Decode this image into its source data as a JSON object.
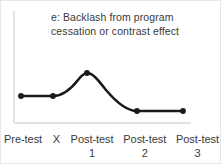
{
  "chart_data": {
    "type": "line",
    "title": "e: Backlash from program\ncessation or contrast effect",
    "xlabel": "",
    "ylabel": "",
    "categories": [
      "Pre-test",
      "X",
      "Post-test 1",
      "Post-test 2",
      "Post-test 3"
    ],
    "tick_labels": [
      {
        "main": "Pre-test",
        "sub": ""
      },
      {
        "main": "X",
        "sub": ""
      },
      {
        "main": "Post-test",
        "sub": "1"
      },
      {
        "main": "Post-test",
        "sub": "2"
      },
      {
        "main": "Post-test",
        "sub": "3"
      }
    ],
    "values": [
      30,
      30,
      55,
      13,
      13
    ],
    "ylim": [
      0,
      70
    ],
    "xlim": [
      0,
      4
    ],
    "grid": false,
    "legend": null,
    "smooth": true,
    "line_color": "#1a1a1a",
    "marker_color": "#1a1a1a",
    "axis_color": "#d9d9d9",
    "text_color": "#3a3a3a",
    "points_px": [
      {
        "x": 20,
        "y": 95
      },
      {
        "x": 52,
        "y": 95
      },
      {
        "x": 86,
        "y": 72
      },
      {
        "x": 136,
        "y": 110
      },
      {
        "x": 182,
        "y": 110
      }
    ],
    "path_d": "M 20 95 L 52 95 C 62 95 70 88 77 79 C 80.5 74.5 83 72 86 72 C 92 72 97 79 105 89 C 116 102 126 110 136 110 L 182 110",
    "axis_lines": {
      "y_axis": {
        "x": 13,
        "y1": 10,
        "y2": 122
      },
      "x_axis": {
        "y": 122,
        "x1": 13,
        "x2": 190
      }
    }
  }
}
